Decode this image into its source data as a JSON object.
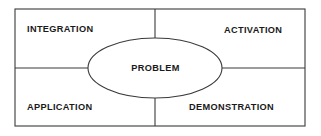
{
  "diagram": {
    "center": {
      "label": "PROBLEM",
      "shape": "ellipse"
    },
    "quadrants": [
      {
        "position": "top-left",
        "label": "INTEGRATION"
      },
      {
        "position": "top-right",
        "label": "ACTIVATION"
      },
      {
        "position": "bottom-left",
        "label": "APPLICATION"
      },
      {
        "position": "bottom-right",
        "label": "DEMONSTRATION"
      }
    ],
    "style": {
      "background": "#ffffff",
      "stroke": "#3a3a3a",
      "text": "#1a1a1a",
      "fill": "#ffffff"
    },
    "geometry": {
      "frame": {
        "x": 15,
        "y": 9,
        "width": 290,
        "height": 117
      },
      "ellipse": {
        "cx": 155,
        "cy": 68,
        "rx": 67,
        "ry": 30
      },
      "divider_vertical_x": 155,
      "divider_horizontal_y": 68
    }
  }
}
